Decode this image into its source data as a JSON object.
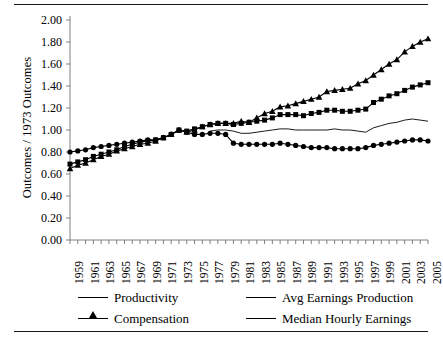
{
  "chart_data": {
    "type": "line",
    "title": "",
    "xlabel": "",
    "ylabel": "Outcomes / 1973 Outcomes",
    "ylim": [
      0.0,
      2.0
    ],
    "ytick_labels": [
      "0.00",
      "0.20",
      "0.40",
      "0.60",
      "0.80",
      "1.00",
      "1.20",
      "1.40",
      "1.60",
      "1.80",
      "2.00"
    ],
    "ytick_values": [
      0.0,
      0.2,
      0.4,
      0.6,
      0.8,
      1.0,
      1.2,
      1.4,
      1.6,
      1.8,
      2.0
    ],
    "xlim": [
      1959,
      2005
    ],
    "x": [
      1959,
      1960,
      1961,
      1962,
      1963,
      1964,
      1965,
      1966,
      1967,
      1968,
      1969,
      1970,
      1971,
      1972,
      1973,
      1974,
      1975,
      1976,
      1977,
      1978,
      1979,
      1980,
      1981,
      1982,
      1983,
      1984,
      1985,
      1986,
      1987,
      1988,
      1989,
      1990,
      1991,
      1992,
      1993,
      1994,
      1995,
      1996,
      1997,
      1998,
      1999,
      2000,
      2001,
      2002,
      2003,
      2004,
      2005
    ],
    "xtick_labels": [
      "1959",
      "1961",
      "1963",
      "1965",
      "1967",
      "1969",
      "1971",
      "1973",
      "1975",
      "1977",
      "1979",
      "1981",
      "1983",
      "1985",
      "1987",
      "1989",
      "1991",
      "1993",
      "1995",
      "1997",
      "1999",
      "2001",
      "2003",
      "2005"
    ],
    "xtick_step_years": 2,
    "minor_ticks_every_year": true,
    "grid": false,
    "legend_position": "below-axis",
    "series": [
      {
        "name": "Productivity",
        "marker": "triangle",
        "values": [
          0.65,
          0.68,
          0.7,
          0.73,
          0.76,
          0.78,
          0.81,
          0.83,
          0.85,
          0.87,
          0.88,
          0.9,
          0.93,
          0.96,
          1.0,
          0.98,
          1.0,
          1.03,
          1.05,
          1.06,
          1.06,
          1.06,
          1.08,
          1.07,
          1.11,
          1.15,
          1.17,
          1.21,
          1.22,
          1.24,
          1.26,
          1.28,
          1.3,
          1.35,
          1.36,
          1.37,
          1.38,
          1.42,
          1.45,
          1.5,
          1.55,
          1.6,
          1.64,
          1.71,
          1.76,
          1.8,
          1.83
        ]
      },
      {
        "name": "Compensation",
        "marker": "square",
        "values": [
          0.69,
          0.71,
          0.73,
          0.76,
          0.78,
          0.8,
          0.82,
          0.85,
          0.87,
          0.89,
          0.9,
          0.91,
          0.93,
          0.96,
          1.0,
          0.99,
          1.01,
          1.03,
          1.05,
          1.06,
          1.06,
          1.05,
          1.06,
          1.07,
          1.08,
          1.09,
          1.11,
          1.14,
          1.14,
          1.14,
          1.13,
          1.15,
          1.16,
          1.18,
          1.18,
          1.17,
          1.17,
          1.18,
          1.19,
          1.25,
          1.28,
          1.31,
          1.33,
          1.36,
          1.39,
          1.41,
          1.43
        ]
      },
      {
        "name": "Avg Earnings Production",
        "marker": "circle",
        "values": [
          0.8,
          0.81,
          0.82,
          0.84,
          0.85,
          0.86,
          0.87,
          0.88,
          0.89,
          0.9,
          0.91,
          0.91,
          0.93,
          0.96,
          1.0,
          0.98,
          0.96,
          0.96,
          0.97,
          0.97,
          0.96,
          0.88,
          0.87,
          0.87,
          0.87,
          0.87,
          0.87,
          0.88,
          0.87,
          0.86,
          0.85,
          0.84,
          0.84,
          0.84,
          0.83,
          0.83,
          0.83,
          0.83,
          0.84,
          0.86,
          0.87,
          0.88,
          0.89,
          0.9,
          0.91,
          0.91,
          0.9
        ]
      },
      {
        "name": "Median Hourly Earnings",
        "marker": "none",
        "values": [
          null,
          null,
          null,
          null,
          null,
          null,
          null,
          null,
          null,
          null,
          null,
          null,
          null,
          null,
          null,
          null,
          null,
          null,
          0.99,
          1.0,
          1.0,
          0.99,
          0.97,
          0.97,
          0.98,
          0.99,
          1.0,
          1.01,
          1.01,
          1.0,
          1.0,
          1.0,
          1.0,
          1.0,
          1.01,
          1.0,
          1.0,
          0.99,
          0.98,
          1.02,
          1.04,
          1.06,
          1.07,
          1.09,
          1.1,
          1.09,
          1.08
        ]
      }
    ]
  },
  "legend": {
    "entries": [
      {
        "label": "Productivity",
        "marker": "triangle-marker"
      },
      {
        "label": "Avg Earnings Production",
        "marker": "circle-marker"
      },
      {
        "label": "Compensation",
        "marker": "square-marker"
      },
      {
        "label": "Median Hourly Earnings",
        "marker": "plain-line"
      }
    ]
  },
  "colors": {
    "line": "#000000",
    "axis": "#808080",
    "rule": "#1a1a1a",
    "background": "#ffffff"
  }
}
